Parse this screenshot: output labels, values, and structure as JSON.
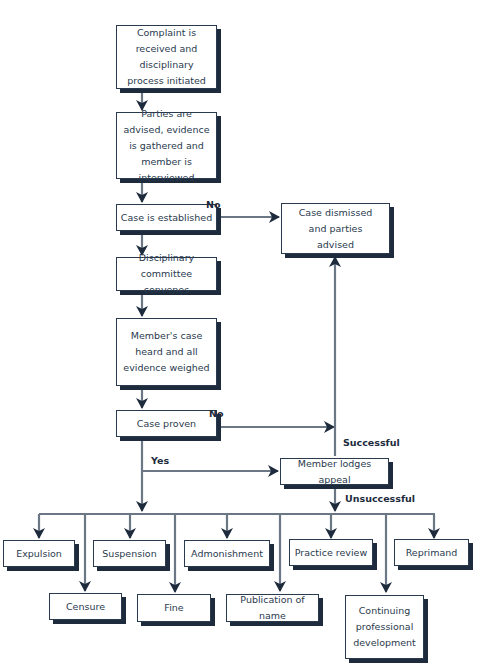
{
  "diagram": {
    "type": "flowchart",
    "colors": {
      "line": "#6b7785",
      "arrowhead": "#1d2b3c",
      "box_border": "#2a3a4e",
      "box_shadow": "#1d2b3c",
      "text": "#2a3a4e",
      "background": "#ffffff"
    },
    "nodes": {
      "complaint": "Complaint is received and disciplinary process initiated",
      "parties": "Parties are advised, evidence is gathered and member is interviewed",
      "established": "Case is established",
      "committee": "Disciplinary committee convenes",
      "heard": "Member's case heard and all evidence weighed",
      "proven": "Case proven",
      "dismissed": "Case dismissed and parties advised",
      "appeal": "Member lodges appeal",
      "expulsion": "Expulsion",
      "censure": "Censure",
      "suspension": "Suspension",
      "fine": "Fine",
      "admonishment": "Admonishment",
      "publication": "Publication of name",
      "practice_review": "Practice review",
      "cpd": "Continuing professional development",
      "reprimand": "Reprimand"
    },
    "edge_labels": {
      "established_no": "No",
      "proven_no": "No",
      "proven_yes": "Yes",
      "appeal_successful": "Successful",
      "appeal_unsuccessful": "Unsuccessful"
    },
    "edges": [
      {
        "from": "complaint",
        "to": "parties"
      },
      {
        "from": "parties",
        "to": "established"
      },
      {
        "from": "established",
        "to": "committee",
        "label": ""
      },
      {
        "from": "established",
        "to": "dismissed",
        "label": "No"
      },
      {
        "from": "committee",
        "to": "heard"
      },
      {
        "from": "heard",
        "to": "proven"
      },
      {
        "from": "proven",
        "to": "dismissed",
        "label": "No"
      },
      {
        "from": "proven",
        "to": "appeal",
        "label": "Yes"
      },
      {
        "from": "proven",
        "to": "sanctions",
        "label": "Yes"
      },
      {
        "from": "appeal",
        "to": "dismissed",
        "label": "Successful"
      },
      {
        "from": "appeal",
        "to": "sanctions",
        "label": "Unsuccessful"
      }
    ]
  }
}
